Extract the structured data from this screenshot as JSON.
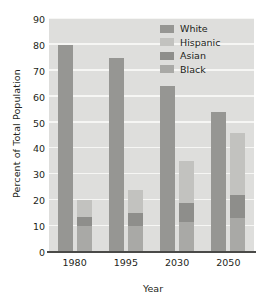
{
  "chart_data": {
    "type": "bar",
    "title": "",
    "subtitle": "",
    "xlabel": "Year",
    "ylabel": "Percent of Total Population",
    "categories": [
      "1980",
      "1995",
      "2030",
      "2050"
    ],
    "ylim": [
      0,
      90
    ],
    "yticks": [
      0,
      10,
      20,
      30,
      40,
      50,
      60,
      70,
      80,
      90
    ],
    "grid": true,
    "legend_position": "top-right",
    "legend": [
      "White",
      "Hispanic",
      "Asian",
      "Black"
    ],
    "series": [
      {
        "name": "White",
        "values": [
          80,
          75,
          64,
          54
        ]
      },
      {
        "name": "Hispanic",
        "values": [
          6.5,
          9,
          16,
          24
        ]
      },
      {
        "name": "Asian",
        "values": [
          3.5,
          5,
          7.5,
          9
        ]
      },
      {
        "name": "Black",
        "values": [
          10,
          10,
          11.5,
          13
        ]
      }
    ],
    "stacked_totals": [
      20,
      24,
      35,
      46
    ]
  },
  "colors": {
    "plot_background": "#dededc",
    "gridline": "#f6f6f4",
    "axis_line": "#4a4a48",
    "text": "#231f20",
    "white_series": "#969693",
    "hispanic_series": "#c2c2bf",
    "asian_series": "#8e8e8b",
    "black_series": "#a9a9a6",
    "page_background": "#ffffff"
  },
  "axis": {
    "y_title": "Percent of Total Population",
    "x_title": "Year",
    "y_tick_labels": [
      "0",
      "10",
      "20",
      "30",
      "40",
      "50",
      "60",
      "70",
      "80",
      "90"
    ],
    "x_tick_labels": [
      "1980",
      "1995",
      "2030",
      "2050"
    ]
  }
}
